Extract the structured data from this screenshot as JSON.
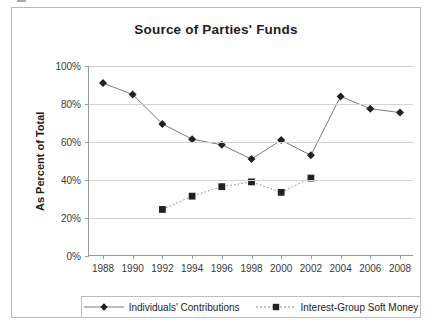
{
  "chart_data": {
    "type": "line",
    "title": "Source of Parties' Funds",
    "xlabel": "",
    "ylabel": "As Percent of Total",
    "x": [
      1988,
      1990,
      1992,
      1994,
      1996,
      1998,
      2000,
      2002,
      2004,
      2006,
      2008
    ],
    "xtick_labels": [
      "1988",
      "1990",
      "1992",
      "1994",
      "1996",
      "1998",
      "2000",
      "2002",
      "2004",
      "2006",
      "2008"
    ],
    "ytick_labels": [
      "0%",
      "20%",
      "40%",
      "60%",
      "80%",
      "100%"
    ],
    "ytick_values": [
      0,
      20,
      40,
      60,
      80,
      100
    ],
    "ylim": [
      0,
      100
    ],
    "xlim": [
      1988,
      2008
    ],
    "grid": "horizontal",
    "legend_position": "bottom",
    "series": [
      {
        "name": "Individuals' Contributions",
        "marker": "diamond",
        "linestyle": "solid",
        "color": "#222222",
        "line_color": "#7a7a7a",
        "x": [
          1988,
          1990,
          1992,
          1994,
          1996,
          1998,
          2000,
          2002,
          2004,
          2006,
          2008
        ],
        "values": [
          91,
          85,
          69.5,
          61.5,
          58.5,
          51,
          61,
          53,
          84,
          77.5,
          75.5
        ]
      },
      {
        "name": "Interest-Group Soft Money",
        "marker": "square",
        "linestyle": "dotted",
        "color": "#222222",
        "line_color": "#8d8d8d",
        "x": [
          1992,
          1994,
          1996,
          1998,
          2000,
          2002
        ],
        "values": [
          24.5,
          31.5,
          36.5,
          39,
          33.5,
          41
        ]
      }
    ]
  },
  "legend": {
    "entries": [
      {
        "label": "Individuals' Contributions"
      },
      {
        "label": "Interest-Group Soft Money"
      }
    ]
  },
  "colors": {
    "frame": "#b9b9b9",
    "axis": "#9a9a9a",
    "grid": "#d2d2d2",
    "text": "#1d1d1d",
    "marker": "#222222"
  }
}
